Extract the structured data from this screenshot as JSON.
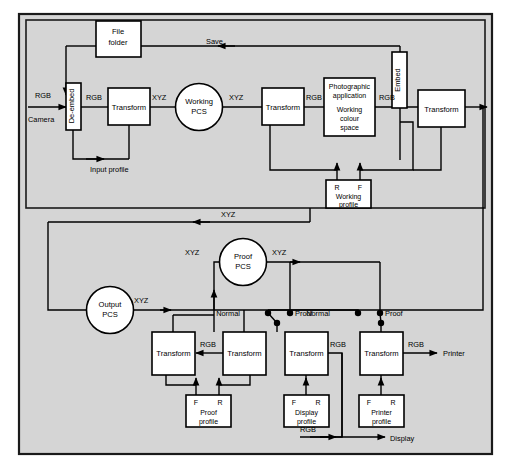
{
  "diagram": {
    "background": "#d4d4d4",
    "frame_border": "#1a1a1a",
    "box_fill": "#ffffff",
    "line_color": "#000000",
    "sections": {
      "top": "capture and working space",
      "bottom": "proof, display and print"
    }
  },
  "top_row": {
    "source_label": "RGB",
    "source_device": "Camera",
    "deembed_box": "De-embed",
    "deembed_out": "RGB",
    "input_profile": "Input profile",
    "transform1": "Transform",
    "transform1_out": "XYZ",
    "working_pcs_line1": "Working",
    "working_pcs_line2": "PCS",
    "working_pcs_out": "XYZ",
    "transform2": "Transform",
    "transform2_out": "RGB",
    "photo_app_line1": "Photographic",
    "photo_app_line2": "application",
    "photo_app_line3": "Working",
    "photo_app_line4": "colour",
    "photo_app_line5": "space",
    "photo_app_out": "RGB",
    "embed_box": "Embed",
    "transform3": "Transform",
    "file_folder_line1": "File",
    "file_folder_line2": "folder",
    "save_label": "Save",
    "working_profile_r": "R",
    "working_profile_f": "F",
    "working_profile_line1": "Working",
    "working_profile_line2": "profile"
  },
  "mid_row": {
    "feedback_label": "XYZ",
    "output_pcs_line1": "Output",
    "output_pcs_line2": "PCS",
    "output_pcs_out": "XYZ",
    "proof_pcs_in": "XYZ",
    "proof_pcs_line1": "Proof",
    "proof_pcs_line2": "PCS",
    "proof_pcs_out": "XYZ"
  },
  "switches": [
    {
      "normal": "Normal",
      "proof": "Proof"
    },
    {
      "normal": "Normal",
      "proof": "Proof"
    }
  ],
  "bottom_row": {
    "transform_proof_a": "Transform",
    "transform_proof_b": "Transform",
    "rgb_between_proof": "RGB",
    "transform_display": "Transform",
    "rgb_display": "RGB",
    "transform_printer": "Transform",
    "rgb_printer": "RGB",
    "printer_out": "Printer",
    "display_out": "Display",
    "rgb_display_out": "RGB"
  },
  "profiles": [
    {
      "left_tag": "F",
      "right_tag": "R",
      "line1": "Proof",
      "line2": "profile"
    },
    {
      "left_tag": "F",
      "right_tag": "R",
      "line1": "Display",
      "line2": "profile"
    },
    {
      "left_tag": "F",
      "right_tag": "R",
      "line1": "Printer",
      "line2": "profile"
    }
  ]
}
